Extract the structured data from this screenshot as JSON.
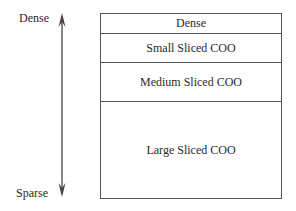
{
  "axis": {
    "top_label": "Dense",
    "bottom_label": "Sparse",
    "direction": "bidirectional-vertical-arrow"
  },
  "layers": [
    {
      "label": "Dense",
      "top": 0,
      "height": 20
    },
    {
      "label": "Small Sliced COO",
      "top": 20,
      "height": 29
    },
    {
      "label": "Medium Sliced COO",
      "top": 49,
      "height": 39
    },
    {
      "label": "Large Sliced COO",
      "top": 88,
      "height": 97
    }
  ]
}
